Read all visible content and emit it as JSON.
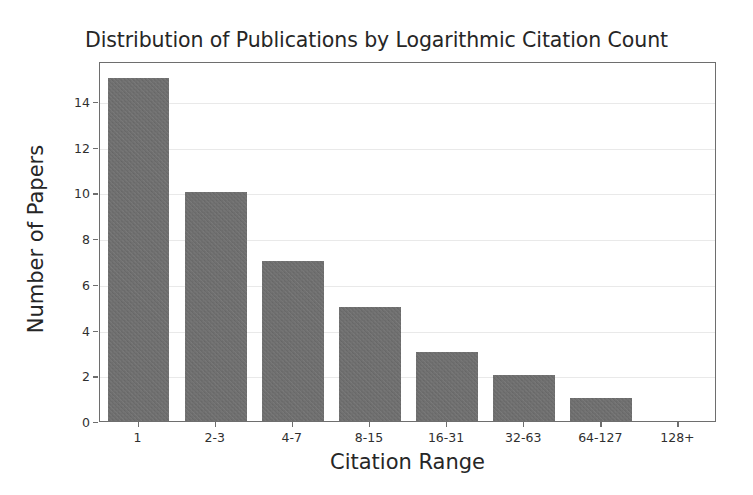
{
  "chart_data": {
    "type": "bar",
    "title": "Distribution of Publications by Logarithmic Citation Count",
    "xlabel": "Citation Range",
    "ylabel": "Number of Papers",
    "categories": [
      "1",
      "2-3",
      "4-7",
      "8-15",
      "16-31",
      "32-63",
      "64-127",
      "128+"
    ],
    "values": [
      15,
      10,
      7,
      5,
      3,
      2,
      1,
      0
    ],
    "ytick_labels": [
      "0",
      "2",
      "4",
      "6",
      "8",
      "10",
      "12",
      "14"
    ],
    "ytick_values": [
      0,
      2,
      4,
      6,
      8,
      10,
      12,
      14
    ],
    "ylim": [
      0,
      15.75
    ],
    "xlim": [
      -0.5,
      7.5
    ],
    "grid": "horizontal",
    "legend": "none",
    "bar_color": "#6e6e6e",
    "grid_color": "#e9e9e9",
    "axis_color": "#6e6e6e",
    "text_color": "#262626",
    "background_color": "#ffffff"
  }
}
